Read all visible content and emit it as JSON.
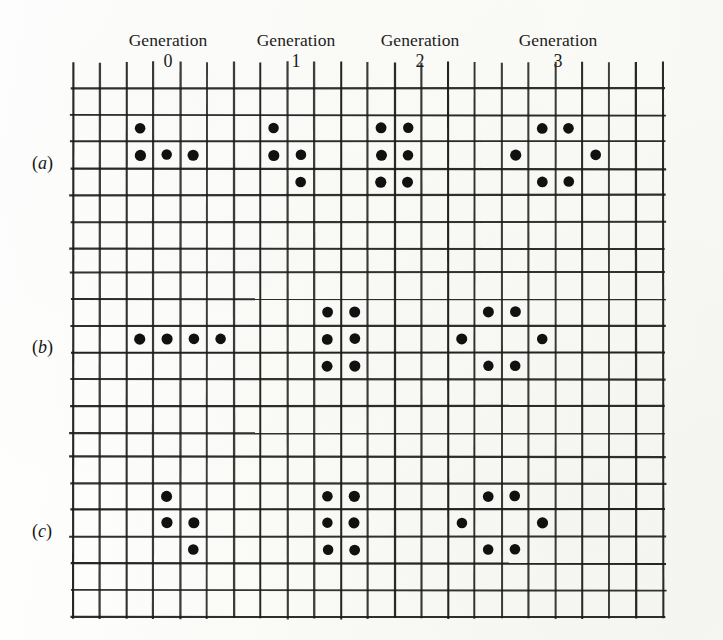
{
  "figure": {
    "kind": "life-generation-grid",
    "background_color": "#fdfdfb",
    "ink_color": "#141414",
    "grid": {
      "origin_x": 73,
      "origin_y": 62,
      "cell": 26.8,
      "columns": 22,
      "line_color": "#1b1b1b",
      "line_width": 2.1
    },
    "generation_labels": [
      {
        "word": "Generation",
        "number": "0",
        "center_x": 168
      },
      {
        "word": "Generation",
        "number": "1",
        "center_x": 296
      },
      {
        "word": "Generation",
        "number": "2",
        "center_x": 420
      },
      {
        "word": "Generation",
        "number": "3",
        "center_x": 558
      }
    ],
    "panels": [
      {
        "label": "(a)",
        "label_paren_open": "(",
        "label_letter": "a",
        "label_paren_close": ")",
        "label_x": 32,
        "label_y": 153,
        "top": 88,
        "rows": 6,
        "dots": [
          [
            2,
            1
          ],
          [
            2,
            2
          ],
          [
            3,
            2
          ],
          [
            4,
            2
          ],
          [
            7,
            1
          ],
          [
            7,
            2
          ],
          [
            8,
            2
          ],
          [
            8,
            3
          ],
          [
            11,
            1
          ],
          [
            12,
            1
          ],
          [
            11,
            2
          ],
          [
            12,
            2
          ],
          [
            11,
            3
          ],
          [
            12,
            3
          ],
          [
            17,
            1
          ],
          [
            18,
            1
          ],
          [
            16,
            2
          ],
          [
            19,
            2
          ],
          [
            17,
            3
          ],
          [
            18,
            3
          ]
        ]
      },
      {
        "label": "(b)",
        "label_paren_open": "(",
        "label_letter": "b",
        "label_paren_close": ")",
        "label_x": 32,
        "label_y": 337,
        "top": 272,
        "rows": 6,
        "dots": [
          [
            2,
            2
          ],
          [
            3,
            2
          ],
          [
            4,
            2
          ],
          [
            5,
            2
          ],
          [
            9,
            1
          ],
          [
            10,
            1
          ],
          [
            9,
            2
          ],
          [
            10,
            2
          ],
          [
            9,
            3
          ],
          [
            10,
            3
          ],
          [
            15,
            1
          ],
          [
            16,
            1
          ],
          [
            14,
            2
          ],
          [
            17,
            2
          ],
          [
            15,
            3
          ],
          [
            16,
            3
          ]
        ]
      },
      {
        "label": "(c)",
        "label_paren_open": "(",
        "label_letter": "c",
        "label_paren_close": ")",
        "label_x": 32,
        "label_y": 521,
        "top": 456,
        "rows": 6,
        "dots": [
          [
            3,
            1
          ],
          [
            3,
            2
          ],
          [
            4,
            2
          ],
          [
            4,
            3
          ],
          [
            9,
            1
          ],
          [
            10,
            1
          ],
          [
            9,
            2
          ],
          [
            10,
            2
          ],
          [
            9,
            3
          ],
          [
            10,
            3
          ],
          [
            15,
            1
          ],
          [
            16,
            1
          ],
          [
            14,
            2
          ],
          [
            17,
            2
          ],
          [
            15,
            3
          ],
          [
            16,
            3
          ]
        ]
      }
    ],
    "dot": {
      "radius": 5.4,
      "color": "#111111"
    }
  }
}
